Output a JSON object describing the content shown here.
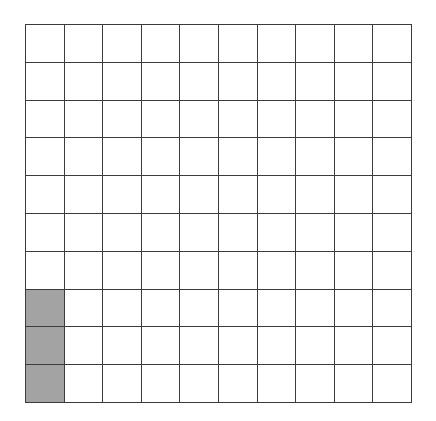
{
  "figure": {
    "name": "hundred-square-grid",
    "rows": 10,
    "columns": 10,
    "total_cells": 100,
    "shaded_cells": 3,
    "unshaded_cells": 97,
    "shaded_positions": [
      {
        "row": 8,
        "column": 1
      },
      {
        "row": 9,
        "column": 1
      },
      {
        "row": 10,
        "column": 1
      }
    ],
    "colors": {
      "background": "#ffffff",
      "grid_line": "#3c3c3c",
      "cell_fill": "#ffffff",
      "shaded_fill": "#a3a3a3"
    }
  },
  "chart_data": {
    "type": "heatmap",
    "title": "",
    "xlabel": "",
    "ylabel": "",
    "rows": 10,
    "columns": 10,
    "grid": [
      [
        0,
        0,
        0,
        0,
        0,
        0,
        0,
        0,
        0,
        0
      ],
      [
        0,
        0,
        0,
        0,
        0,
        0,
        0,
        0,
        0,
        0
      ],
      [
        0,
        0,
        0,
        0,
        0,
        0,
        0,
        0,
        0,
        0
      ],
      [
        0,
        0,
        0,
        0,
        0,
        0,
        0,
        0,
        0,
        0
      ],
      [
        0,
        0,
        0,
        0,
        0,
        0,
        0,
        0,
        0,
        0
      ],
      [
        0,
        0,
        0,
        0,
        0,
        0,
        0,
        0,
        0,
        0
      ],
      [
        0,
        0,
        0,
        0,
        0,
        0,
        0,
        0,
        0,
        0
      ],
      [
        1,
        0,
        0,
        0,
        0,
        0,
        0,
        0,
        0,
        0
      ],
      [
        1,
        0,
        0,
        0,
        0,
        0,
        0,
        0,
        0,
        0
      ],
      [
        1,
        0,
        0,
        0,
        0,
        0,
        0,
        0,
        0,
        0
      ]
    ],
    "value_legend": {
      "0": "unshaded",
      "1": "shaded"
    },
    "shaded_count": 3,
    "total_count": 100,
    "fraction": "3/100",
    "percent": 3,
    "decimal": 0.03
  }
}
